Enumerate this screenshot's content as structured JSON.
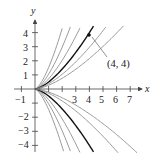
{
  "chart_data": {
    "type": "line",
    "title": "",
    "xlabel": "x",
    "ylabel": "y",
    "xlim": [
      -1.3,
      7.9
    ],
    "ylim": [
      -4.6,
      5.0
    ],
    "grid": false,
    "x_ticks": [
      -1,
      1,
      2,
      3,
      4,
      5,
      6,
      7
    ],
    "x_tick_labels": [
      "−1",
      "",
      "",
      "3",
      "4",
      "5",
      "6",
      "7"
    ],
    "y_ticks": [
      -4,
      -3,
      -2,
      -1,
      1,
      2,
      3,
      4
    ],
    "y_tick_labels": [
      "−4",
      "−3",
      "−2",
      "",
      "1",
      "2",
      "3",
      "4"
    ],
    "family": "y = ±C·x^(3/2)",
    "series": [
      {
        "name": "C=1.52",
        "C": 1.52,
        "sign": 1,
        "highlight": false
      },
      {
        "name": "C=1.05",
        "C": 1.05,
        "sign": 1,
        "highlight": false
      },
      {
        "name": "C=0.72",
        "C": 0.72,
        "sign": 1,
        "highlight": false
      },
      {
        "name": "C=0.5",
        "C": 0.5,
        "sign": 1,
        "highlight": true
      },
      {
        "name": "C=0.37",
        "C": 0.37,
        "sign": 1,
        "highlight": false
      },
      {
        "name": "C=0.27",
        "C": 0.27,
        "sign": 1,
        "highlight": false
      },
      {
        "name": "C=-1.45",
        "C": 1.45,
        "sign": -1,
        "highlight": false
      },
      {
        "name": "C=-1.05",
        "C": 1.05,
        "sign": -1,
        "highlight": false
      },
      {
        "name": "C=-0.75",
        "C": 0.75,
        "sign": -1,
        "highlight": false
      },
      {
        "name": "C=-0.5",
        "C": 0.5,
        "sign": -1,
        "highlight": true
      },
      {
        "name": "C=-0.3",
        "C": 0.3,
        "sign": -1,
        "highlight": false
      },
      {
        "name": "C=-0.22",
        "C": 0.22,
        "sign": -1,
        "highlight": false
      }
    ],
    "annotations": [
      {
        "text": "(4, 4)",
        "point": [
          4,
          4
        ]
      }
    ]
  },
  "labels": {
    "x_axis": "x",
    "y_axis": "y",
    "point": "(4, 4)",
    "xt_m1": "−1",
    "xt_3": "3",
    "xt_4": "4",
    "xt_5": "5",
    "xt_6": "6",
    "xt_7": "7",
    "yt_4": "4",
    "yt_3": "3",
    "yt_2": "2",
    "yt_1": "1",
    "yt_m2": "−2",
    "yt_m3": "−3",
    "yt_m4": "−4"
  },
  "colors": {
    "curve": "#9a9a9a",
    "highlight": "#111111",
    "axis": "#444444"
  }
}
